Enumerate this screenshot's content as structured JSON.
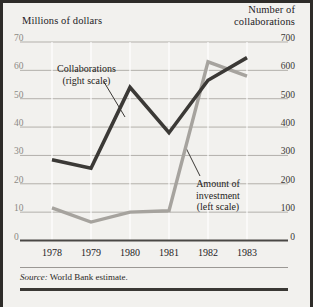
{
  "figure": {
    "background_color": "#f2f1ee",
    "frame_color": "#2e2c29",
    "source_lead": "Source:",
    "source_text": " World Bank estimate."
  },
  "annotations": {
    "collaborations": {
      "line1": "Collaborations",
      "line2": "(right scale)"
    },
    "investment": {
      "line1": "Amount of",
      "line2": "investment",
      "line3": "(left scale)"
    }
  },
  "chart_data": {
    "type": "line",
    "title": "",
    "xlabel": "",
    "ylabel": "Millions of dollars",
    "y2label": "Number of collaborations",
    "left_axis_title_line1": "Millions of dollars",
    "right_axis_title_line1": "Number of",
    "right_axis_title_line2": "collaborations",
    "categories": [
      "1978",
      "1979",
      "1980",
      "1981",
      "1982",
      "1983"
    ],
    "x": [
      1978,
      1979,
      1980,
      1981,
      1982,
      1983
    ],
    "ylim": [
      0,
      70
    ],
    "y2lim": [
      0,
      700
    ],
    "yticks": [
      0,
      10,
      20,
      30,
      40,
      50,
      60,
      70
    ],
    "y2ticks": [
      0,
      100,
      200,
      300,
      400,
      500,
      600,
      700
    ],
    "grid": true,
    "legend": "annotations",
    "series": [
      {
        "name": "Collaborations (right scale)",
        "axis": "right",
        "color": "#3b3936",
        "values": [
          285,
          255,
          540,
          380,
          565,
          645
        ]
      },
      {
        "name": "Amount of investment (left scale)",
        "axis": "left",
        "color": "#a6a39e",
        "values": [
          11.5,
          6.5,
          10,
          10.5,
          63,
          58
        ]
      }
    ]
  }
}
